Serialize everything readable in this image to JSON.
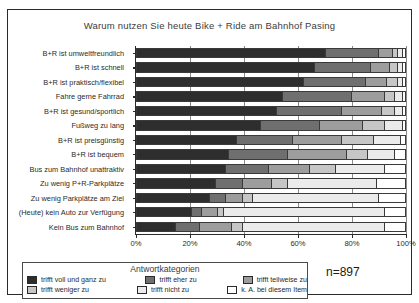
{
  "chart_data": {
    "type": "bar",
    "subtype": "stacked-horizontal-100",
    "title": "Warum nutzen Sie heute Bike + Ride am Bahnhof Pasing",
    "xlabel": "",
    "ylabel": "",
    "xlim": [
      0,
      100
    ],
    "xticks": [
      "0%",
      "20%",
      "40%",
      "60%",
      "80%",
      "100%"
    ],
    "xtick_values": [
      0,
      20,
      40,
      60,
      80,
      100
    ],
    "grid": true,
    "legend_position": "bottom-left",
    "legend_title": "Antwortkategorien",
    "sample_size_label": "n=897",
    "categories": [
      "B+R ist umweltfreundlich",
      "B+R ist schnell",
      "B+R ist praktisch/flexibel",
      "Fahre gerne Fahrrad",
      "B+R ist gesund/sportlich",
      "Fußweg zu lang",
      "B+R ist preisgünstig",
      "B+R ist bequem",
      "Bus zum Bahnhof unattraktiv",
      "Zu wenig P+R-Parkplätze",
      "Zu wenig Parkplätze am Ziel",
      "(Heute) kein Auto zur Verfügung",
      "Kein Bus zum Bahnhof"
    ],
    "series": [
      {
        "name": "trifft voll und ganz zu",
        "color": "#2e2e2e",
        "values": [
          70,
          66,
          62,
          54,
          52,
          46,
          37,
          34,
          33,
          29,
          27,
          20,
          14
        ]
      },
      {
        "name": "trifft eher zu",
        "color": "#6f6f6f",
        "values": [
          20,
          21,
          23,
          26,
          24,
          22,
          21,
          22,
          16,
          10,
          6,
          4,
          9
        ]
      },
      {
        "name": "trifft teilweise zu",
        "color": "#9d9d9d",
        "values": [
          5,
          7,
          8,
          12,
          15,
          16,
          18,
          22,
          15,
          11,
          6,
          6,
          12
        ]
      },
      {
        "name": "trifft weniger zu",
        "color": "#c6c6c6",
        "values": [
          2,
          3,
          4,
          4,
          5,
          8,
          12,
          8,
          10,
          6,
          4,
          2,
          4
        ]
      },
      {
        "name": "trifft nicht zu",
        "color": "#ebebeb",
        "values": [
          2,
          2,
          2,
          3,
          3,
          7,
          10,
          10,
          18,
          33,
          47,
          60,
          53
        ]
      },
      {
        "name": "k. A. bei diesem Item",
        "color": "#ffffff",
        "values": [
          1,
          1,
          1,
          1,
          1,
          1,
          2,
          4,
          8,
          11,
          10,
          8,
          8
        ]
      }
    ]
  }
}
